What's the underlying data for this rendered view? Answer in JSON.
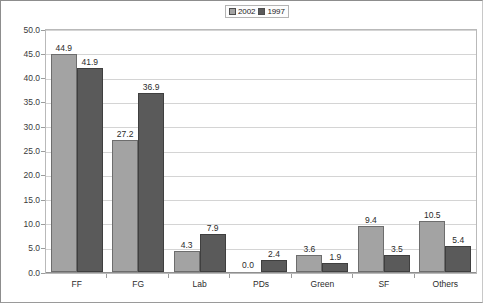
{
  "chart_data": {
    "type": "bar",
    "title": "",
    "xlabel": "",
    "ylabel": "",
    "categories": [
      "FF",
      "FG",
      "Lab",
      "PDs",
      "Green",
      "SF",
      "Others"
    ],
    "series": [
      {
        "name": "2002",
        "color": "#a3a3a3",
        "values": [
          44.9,
          27.2,
          4.3,
          0.0,
          3.6,
          9.4,
          10.5
        ]
      },
      {
        "name": "1997",
        "color": "#5a5a5a",
        "values": [
          41.9,
          36.9,
          7.9,
          2.4,
          1.9,
          3.5,
          5.4
        ]
      }
    ],
    "value_labels": [
      [
        "44.9",
        "27.2",
        "4.3",
        "0.0",
        "3.6",
        "9.4",
        "10.5"
      ],
      [
        "41.9",
        "36.9",
        "7.9",
        "2.4",
        "1.9",
        "3.5",
        "5.4"
      ]
    ],
    "ylim": [
      0.0,
      50.0
    ],
    "ytick_step": 5.0,
    "ytick_labels": [
      "50.0",
      "45.0",
      "40.0",
      "35.0",
      "30.0",
      "25.0",
      "20.0",
      "15.0",
      "10.0",
      "5.0",
      "0.0"
    ],
    "ytick_values": [
      50.0,
      45.0,
      40.0,
      35.0,
      30.0,
      25.0,
      20.0,
      15.0,
      10.0,
      5.0,
      0.0
    ],
    "grid": "horizontal",
    "legend_position": "top-center",
    "legend_entries": [
      "2002",
      "1997"
    ]
  },
  "legend": {
    "items": [
      {
        "label": "2002",
        "swatch": "legend-swatch-2002"
      },
      {
        "label": "1997",
        "swatch": "legend-swatch-1997"
      }
    ]
  }
}
